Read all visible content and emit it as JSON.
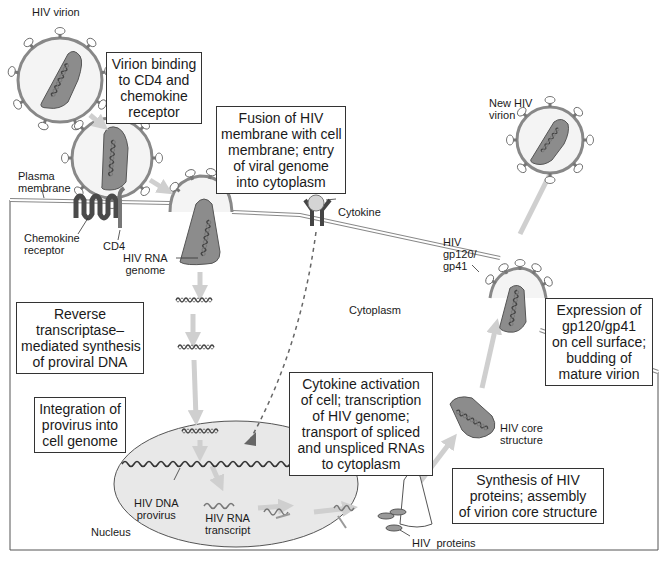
{
  "labels": {
    "hiv_virion": "HIV virion",
    "plasma_membrane": [
      "Plasma",
      "membrane"
    ],
    "chemokine_receptor": [
      "Chemokine",
      "receptor"
    ],
    "cd4": "CD4",
    "hiv_rna_genome": [
      "HIV RNA",
      "genome"
    ],
    "cytokine": "Cytokine",
    "cytoplasm": "Cytoplasm",
    "new_hiv_virion": [
      "New HIV",
      "virion"
    ],
    "hiv_gp120_gp41": [
      "HIV",
      "gp120/",
      "gp41"
    ],
    "hiv_core_structure": [
      "HIV core",
      "structure"
    ],
    "hiv_dna_provirus": [
      "HIV DNA",
      "provirus"
    ],
    "hiv_rna_transcript": [
      "HIV RNA",
      "transcript"
    ],
    "nucleus": "Nucleus",
    "hiv_proteins": "HIV  proteins"
  },
  "steps": [
    {
      "id": "binding",
      "lines": [
        "Virion binding",
        "to CD4 and",
        "chemokine",
        "receptor"
      ]
    },
    {
      "id": "fusion",
      "lines": [
        "Fusion of HIV",
        "membrane with cell",
        "membrane; entry",
        "of viral genome",
        "into cytoplasm"
      ]
    },
    {
      "id": "reverse-transcription",
      "lines": [
        "Reverse",
        "transcriptase–",
        "mediated synthesis",
        "of proviral DNA"
      ]
    },
    {
      "id": "integration",
      "lines": [
        "Integration of",
        "provirus into",
        "cell genome"
      ]
    },
    {
      "id": "activation",
      "lines": [
        "Cytokine activation",
        "of cell; transcription",
        "of HIV genome;",
        "transport of spliced",
        "and unspliced RNAs",
        "to cytoplasm"
      ]
    },
    {
      "id": "synthesis",
      "lines": [
        "Synthesis of HIV",
        "proteins; assembly",
        "of virion core structure"
      ]
    },
    {
      "id": "budding",
      "lines": [
        "Expression of",
        "gp120/gp41",
        "on cell surface;",
        "budding of",
        "mature virion"
      ]
    }
  ],
  "colors": {
    "virion_fill": "#f2f2f2",
    "envelope": "#8a8a8a",
    "core_fill": "#8c8c8c",
    "nucleus_fill": "#e6e6e6",
    "arrow": "#cfcfcf",
    "receptor": "#4a4a4a",
    "cytokine": "#d4d4d4"
  }
}
